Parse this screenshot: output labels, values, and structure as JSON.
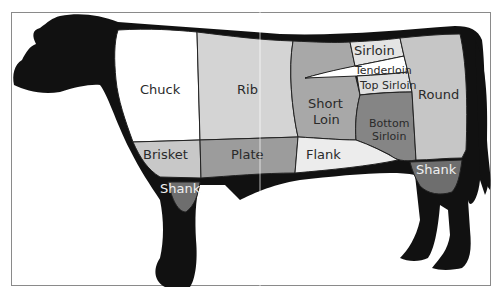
{
  "diagram": {
    "colors": {
      "outline": "#111111",
      "frame": "#8a8a8a",
      "chuck": "#ffffff",
      "rib": "#d4d4d4",
      "short_loin": "#a8a8a8",
      "sirloin": "#e4e4e4",
      "tenderloin": "#ffffff",
      "top_sirloin": "#e0e0e0",
      "bottom_sirloin": "#858585",
      "round": "#c6c6c6",
      "brisket": "#c8c8c8",
      "plate": "#9c9c9c",
      "flank": "#ececec",
      "shank": "#6e6e6e"
    },
    "cuts": {
      "chuck": "Chuck",
      "rib": "Rib",
      "short_loin_1": "Short",
      "short_loin_2": "Loin",
      "sirloin": "Sirloin",
      "tenderloin": "Tenderloin",
      "top_sirloin": "Top Sirloin",
      "bottom_sirloin_1": "Bottom",
      "bottom_sirloin_2": "Sirloin",
      "round": "Round",
      "brisket": "Brisket",
      "plate": "Plate",
      "flank": "Flank",
      "fore_shank": "Shank",
      "hind_shank": "Shank"
    }
  }
}
